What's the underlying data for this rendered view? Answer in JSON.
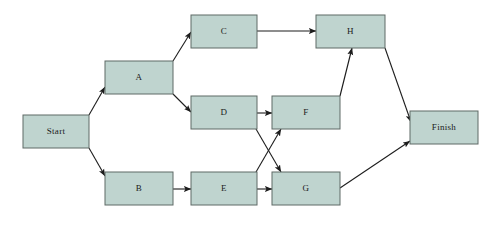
{
  "diagram": {
    "type": "flow-network",
    "canvas": {
      "width": 497,
      "height": 228
    },
    "style": {
      "node_fill": "#bfd4cf",
      "node_stroke": "#5f6a66",
      "edge_color": "#1d1d1d",
      "background": "#ffffff",
      "label_color": "#1a1a1a"
    },
    "nodes": [
      {
        "id": "start",
        "label": "Start",
        "x": 23,
        "y": 115,
        "w": 66,
        "h": 33
      },
      {
        "id": "a",
        "label": "A",
        "x": 105,
        "y": 61,
        "w": 68,
        "h": 33
      },
      {
        "id": "b",
        "label": "B",
        "x": 105,
        "y": 172,
        "w": 68,
        "h": 33
      },
      {
        "id": "c",
        "label": "C",
        "x": 191,
        "y": 15,
        "w": 66,
        "h": 33
      },
      {
        "id": "d",
        "label": "D",
        "x": 191,
        "y": 96,
        "w": 66,
        "h": 33
      },
      {
        "id": "e",
        "label": "E",
        "x": 191,
        "y": 172,
        "w": 66,
        "h": 33
      },
      {
        "id": "f",
        "label": "F",
        "x": 272,
        "y": 96,
        "w": 68,
        "h": 33
      },
      {
        "id": "g",
        "label": "G",
        "x": 272,
        "y": 172,
        "w": 68,
        "h": 33
      },
      {
        "id": "h",
        "label": "H",
        "x": 316,
        "y": 15,
        "w": 69,
        "h": 33
      },
      {
        "id": "finish",
        "label": "Finish",
        "x": 410,
        "y": 111,
        "w": 68,
        "h": 33
      }
    ],
    "edges": [
      {
        "id": "start-a",
        "from": "start",
        "to": "a",
        "x1": 89,
        "y1": 115,
        "x2": 105,
        "y2": 87
      },
      {
        "id": "start-b",
        "from": "start",
        "to": "b",
        "x1": 89,
        "y1": 148,
        "x2": 105,
        "y2": 176
      },
      {
        "id": "a-c",
        "from": "a",
        "to": "c",
        "x1": 173,
        "y1": 61,
        "x2": 191,
        "y2": 32
      },
      {
        "id": "a-d",
        "from": "a",
        "to": "d",
        "x1": 173,
        "y1": 94,
        "x2": 191,
        "y2": 112
      },
      {
        "id": "c-h",
        "from": "c",
        "to": "h",
        "x1": 257,
        "y1": 31,
        "x2": 316,
        "y2": 31
      },
      {
        "id": "d-f",
        "from": "d",
        "to": "f",
        "x1": 257,
        "y1": 113,
        "x2": 272,
        "y2": 113
      },
      {
        "id": "d-g",
        "from": "d",
        "to": "g",
        "x1": 256,
        "y1": 129,
        "x2": 281,
        "y2": 172
      },
      {
        "id": "b-e",
        "from": "b",
        "to": "e",
        "x1": 173,
        "y1": 189,
        "x2": 191,
        "y2": 189
      },
      {
        "id": "e-f",
        "from": "e",
        "to": "f",
        "x1": 256,
        "y1": 172,
        "x2": 281,
        "y2": 129
      },
      {
        "id": "e-g",
        "from": "e",
        "to": "g",
        "x1": 257,
        "y1": 189,
        "x2": 272,
        "y2": 189
      },
      {
        "id": "f-h",
        "from": "f",
        "to": "h",
        "x1": 340,
        "y1": 96,
        "x2": 352,
        "y2": 48
      },
      {
        "id": "h-finish",
        "from": "h",
        "to": "finish",
        "x1": 385,
        "y1": 48,
        "x2": 411,
        "y2": 122
      },
      {
        "id": "g-finish",
        "from": "g",
        "to": "finish",
        "x1": 340,
        "y1": 188,
        "x2": 410,
        "y2": 141
      }
    ]
  }
}
